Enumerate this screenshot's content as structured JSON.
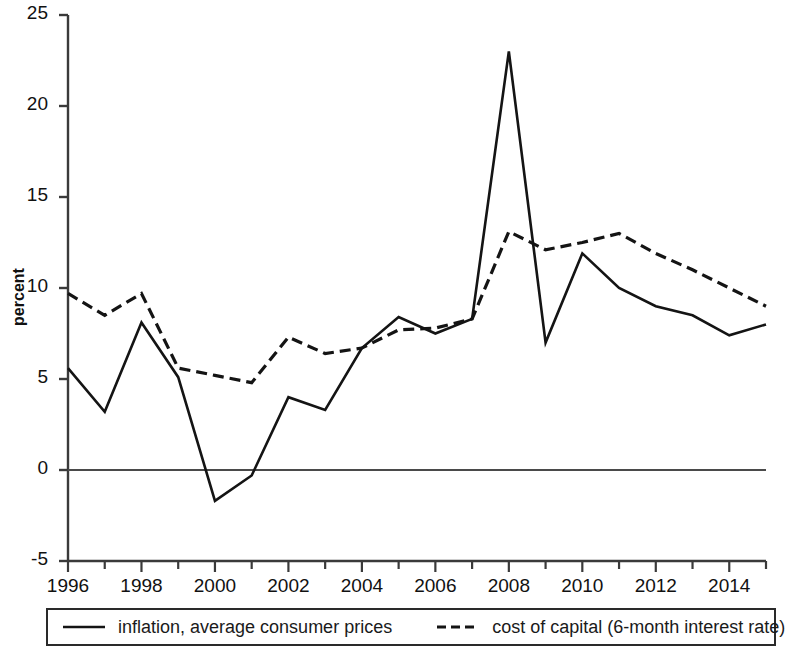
{
  "chart_data": {
    "type": "line",
    "title": "",
    "subtitle": "",
    "xlabel": "",
    "ylabel": "percent",
    "xlim": [
      1996,
      2015
    ],
    "ylim": [
      -5,
      25
    ],
    "grid": false,
    "legend_position": "bottom",
    "y_ticks": [
      25,
      20,
      15,
      10,
      5,
      0,
      -5
    ],
    "y_tick_labels": [
      "25",
      "20",
      "15",
      "10",
      "5",
      "0",
      "-5"
    ],
    "x_ticks": [
      1996,
      1998,
      2000,
      2002,
      2004,
      2006,
      2008,
      2010,
      2012,
      2014
    ],
    "x_tick_labels": [
      "1996",
      "1998",
      "2000",
      "2002",
      "2004",
      "2006",
      "2008",
      "2010",
      "2012",
      "2014"
    ],
    "x_minor_ticks": [
      1997,
      1999,
      2001,
      2003,
      2005,
      2007,
      2009,
      2011,
      2013,
      2015
    ],
    "x": [
      1996,
      1997,
      1998,
      1999,
      2000,
      2001,
      2002,
      2003,
      2004,
      2005,
      2006,
      2007,
      2008,
      2009,
      2010,
      2011,
      2012,
      2013,
      2014,
      2015
    ],
    "series": [
      {
        "name": "inflation, average consumer prices",
        "style": "solid",
        "color": "#141414",
        "values": [
          5.6,
          3.2,
          8.1,
          5.1,
          -1.7,
          -0.3,
          4.0,
          3.3,
          6.7,
          8.4,
          7.5,
          8.3,
          23.0,
          7.0,
          11.9,
          10.0,
          9.0,
          8.5,
          7.4,
          8.0
        ]
      },
      {
        "name": "cost of capital (6-month interest rate)",
        "style": "dashed",
        "color": "#141414",
        "values": [
          9.7,
          8.5,
          9.7,
          5.6,
          5.2,
          4.8,
          7.3,
          6.4,
          6.7,
          7.7,
          7.8,
          8.3,
          13.1,
          12.1,
          12.5,
          13.0,
          11.9,
          11.0,
          10.0,
          9.0
        ]
      }
    ]
  },
  "legend": {
    "entries": [
      {
        "label": "inflation, average consumer prices",
        "style": "solid"
      },
      {
        "label": "cost of capital (6-month interest rate)",
        "style": "dashed"
      }
    ]
  }
}
